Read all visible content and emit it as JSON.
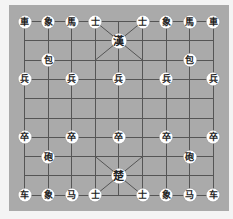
{
  "board": {
    "cols": 9,
    "rows": 10,
    "x0": 24,
    "y0": 21,
    "dx": 23.6,
    "dy": 19.3,
    "colors": {
      "board": "#aaaaaa",
      "line": "#555555",
      "piece": "#ffffff",
      "glyph": "#222222"
    }
  },
  "pieces": [
    {
      "col": 0,
      "row": 0,
      "label": "車",
      "side": "top"
    },
    {
      "col": 1,
      "row": 0,
      "label": "象",
      "side": "top"
    },
    {
      "col": 2,
      "row": 0,
      "label": "馬",
      "side": "top"
    },
    {
      "col": 3,
      "row": 0,
      "label": "士",
      "side": "top"
    },
    {
      "col": 5,
      "row": 0,
      "label": "士",
      "side": "top"
    },
    {
      "col": 6,
      "row": 0,
      "label": "象",
      "side": "top"
    },
    {
      "col": 7,
      "row": 0,
      "label": "馬",
      "side": "top"
    },
    {
      "col": 8,
      "row": 0,
      "label": "車",
      "side": "top"
    },
    {
      "col": 4,
      "row": 1,
      "label": "漢",
      "side": "top",
      "king": true
    },
    {
      "col": 1,
      "row": 2,
      "label": "包",
      "side": "top"
    },
    {
      "col": 7,
      "row": 2,
      "label": "包",
      "side": "top"
    },
    {
      "col": 0,
      "row": 3,
      "label": "兵",
      "side": "top"
    },
    {
      "col": 2,
      "row": 3,
      "label": "兵",
      "side": "top"
    },
    {
      "col": 4,
      "row": 3,
      "label": "兵",
      "side": "top"
    },
    {
      "col": 6,
      "row": 3,
      "label": "兵",
      "side": "top"
    },
    {
      "col": 8,
      "row": 3,
      "label": "兵",
      "side": "top"
    },
    {
      "col": 0,
      "row": 6,
      "label": "卒",
      "side": "bottom"
    },
    {
      "col": 2,
      "row": 6,
      "label": "卒",
      "side": "bottom"
    },
    {
      "col": 4,
      "row": 6,
      "label": "卒",
      "side": "bottom"
    },
    {
      "col": 6,
      "row": 6,
      "label": "卒",
      "side": "bottom"
    },
    {
      "col": 8,
      "row": 6,
      "label": "卒",
      "side": "bottom"
    },
    {
      "col": 1,
      "row": 7,
      "label": "砲",
      "side": "bottom"
    },
    {
      "col": 7,
      "row": 7,
      "label": "砲",
      "side": "bottom"
    },
    {
      "col": 4,
      "row": 8,
      "label": "楚",
      "side": "bottom",
      "king": true
    },
    {
      "col": 0,
      "row": 9,
      "label": "车",
      "side": "bottom"
    },
    {
      "col": 1,
      "row": 9,
      "label": "象",
      "side": "bottom"
    },
    {
      "col": 2,
      "row": 9,
      "label": "马",
      "side": "bottom"
    },
    {
      "col": 3,
      "row": 9,
      "label": "士",
      "side": "bottom"
    },
    {
      "col": 5,
      "row": 9,
      "label": "士",
      "side": "bottom"
    },
    {
      "col": 6,
      "row": 9,
      "label": "象",
      "side": "bottom"
    },
    {
      "col": 7,
      "row": 9,
      "label": "马",
      "side": "bottom"
    },
    {
      "col": 8,
      "row": 9,
      "label": "车",
      "side": "bottom"
    }
  ]
}
